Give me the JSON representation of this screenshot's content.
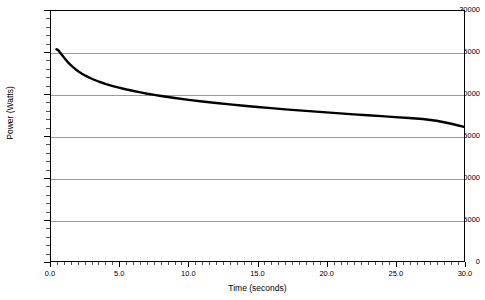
{
  "chart_data": {
    "type": "line",
    "title": "",
    "xlabel": "Time (seconds)",
    "ylabel": "Power (Watts)",
    "xlim": [
      0.0,
      30.0
    ],
    "ylim": [
      0,
      30000
    ],
    "grid": true,
    "grid_axis": "y",
    "legend": "none",
    "x_ticks": [
      "0.0",
      "5.0",
      "10.0",
      "15.0",
      "20.0",
      "25.0",
      "30.0"
    ],
    "x_tick_values": [
      0,
      5,
      10,
      15,
      20,
      25,
      30
    ],
    "x_minor_step": 0.5,
    "y_ticks": [
      "0",
      "5000",
      "10000",
      "15000",
      "20000",
      "25000",
      "30000"
    ],
    "y_tick_values": [
      0,
      5000,
      10000,
      15000,
      20000,
      25000,
      30000
    ],
    "y_minor_step": 1000,
    "series": [
      {
        "name": "Power",
        "color": "#000000",
        "linewidth": 2.4,
        "x": [
          0.4,
          0.5,
          0.6,
          0.7,
          0.8,
          0.9,
          1.0,
          1.2,
          1.4,
          1.6,
          1.8,
          2.0,
          2.25,
          2.5,
          2.75,
          3.0,
          3.5,
          4.0,
          4.5,
          5.0,
          5.5,
          6.0,
          6.5,
          7.0,
          7.5,
          8.0,
          9.0,
          10.0,
          11.0,
          12.0,
          13.0,
          14.0,
          15.0,
          16.0,
          17.0,
          18.0,
          19.0,
          20.0,
          21.0,
          22.0,
          23.0,
          24.0,
          25.0,
          26.0,
          27.0,
          28.0,
          29.0,
          30.0
        ],
        "y": [
          25400,
          25330,
          25150,
          24940,
          24720,
          24500,
          24290,
          23900,
          23560,
          23260,
          22990,
          22750,
          22480,
          22240,
          22030,
          21840,
          21510,
          21230,
          20990,
          20780,
          20580,
          20400,
          20230,
          20070,
          19930,
          19800,
          19560,
          19340,
          19140,
          18960,
          18790,
          18630,
          18480,
          18340,
          18200,
          18070,
          17950,
          17830,
          17710,
          17600,
          17490,
          17380,
          17270,
          17160,
          17040,
          16830,
          16500,
          16100
        ]
      }
    ],
    "annotations": []
  },
  "axes": {
    "y_title": "Power (Watts)",
    "x_title": "Time (seconds)",
    "y_labels": [
      "30000",
      "25000",
      "20000",
      "15000",
      "10000",
      "5000",
      "0"
    ],
    "x_labels": [
      "0.0",
      "5.0",
      "10.0",
      "15.0",
      "20.0",
      "25.0",
      "30.0"
    ]
  },
  "style": {
    "plot_border_color": "#000000",
    "gridline_color": "#9a9a9a",
    "series_color": "#000000",
    "background": "#ffffff"
  }
}
